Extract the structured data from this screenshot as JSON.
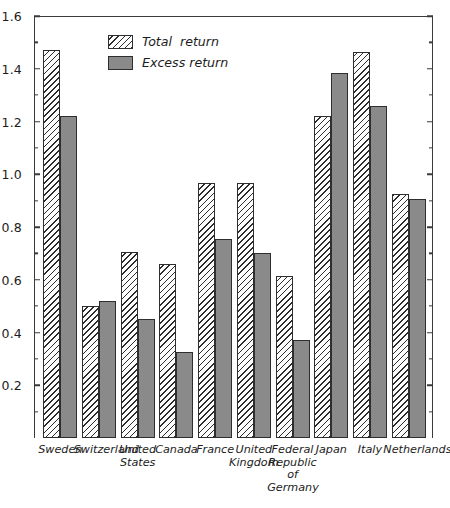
{
  "chart_data": {
    "type": "bar",
    "title": "",
    "xlabel": "",
    "ylabel": "",
    "ylim": [
      0.0,
      1.6
    ],
    "ytick_step": 0.2,
    "yminor_step": 0.1,
    "grid": false,
    "legend_position": "top-left-inside",
    "categories": [
      "Sweden",
      "Switzerland",
      "United\nStates",
      "Canada",
      "France",
      "United\nKingdom",
      "Federal\nRepublic\nof Germany",
      "Japan",
      "Italy",
      "Netherlands"
    ],
    "series": [
      {
        "name": "Total  return",
        "style": "hatched",
        "values": [
          1.47,
          0.5,
          0.705,
          0.66,
          0.965,
          0.965,
          0.615,
          1.22,
          1.465,
          0.925
        ]
      },
      {
        "name": "Excess return",
        "style": "solid-grey",
        "values": [
          1.22,
          0.52,
          0.45,
          0.325,
          0.755,
          0.7,
          0.37,
          1.385,
          1.26,
          0.905
        ]
      }
    ],
    "ytick_labels": [
      "0.2",
      "0.4",
      "0.6",
      "0.8",
      "1.0",
      "1.2",
      "1.4",
      "1.6"
    ],
    "ytick_values": [
      0.2,
      0.4,
      0.6,
      0.8,
      1.0,
      1.2,
      1.4,
      1.6
    ],
    "yminor_values": [
      0.1,
      0.3,
      0.5,
      0.7,
      0.9,
      1.1,
      1.3,
      1.5
    ],
    "colors": {
      "excess_fill": "#8a8a8a",
      "total_fill": "#fdfdfd",
      "hatch": "#2b2b2b",
      "bar_outline": "#2e2e2e",
      "axis": "#3a3a3a",
      "text": "#1c1c1c",
      "background": "#ffffff"
    }
  },
  "legend": {
    "items": [
      {
        "label": "Total  return",
        "swatch": "hatched-swatch"
      },
      {
        "label": "Excess return",
        "swatch": "grey-swatch"
      }
    ]
  }
}
